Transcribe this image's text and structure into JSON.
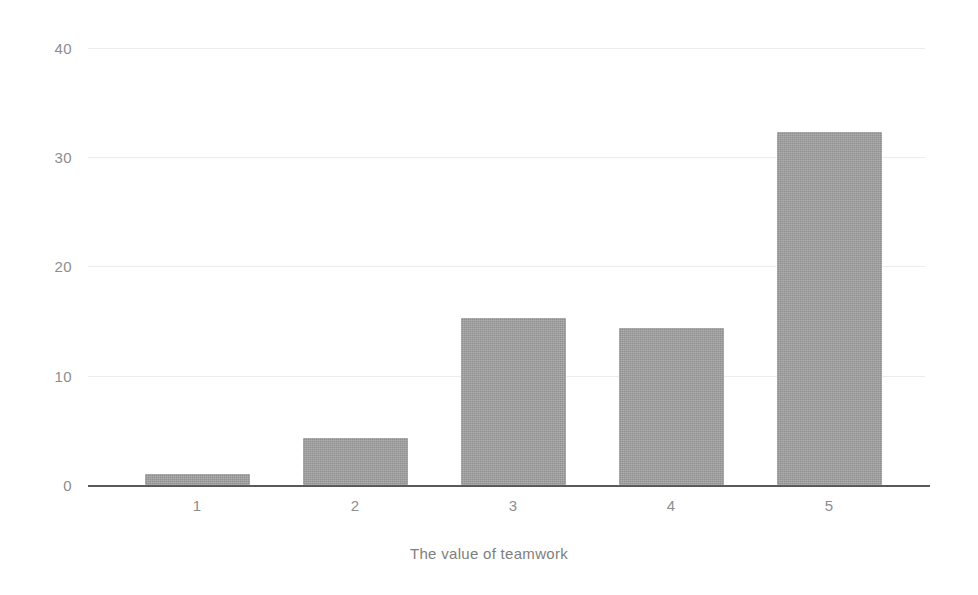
{
  "chart_data": {
    "type": "bar",
    "title": "",
    "subtitle": "",
    "xlabel": "The value of teamwork",
    "ylabel": "",
    "categories": [
      "1",
      "2",
      "3",
      "4",
      "5"
    ],
    "values": [
      1.0,
      4.3,
      15.3,
      14.4,
      32.3
    ],
    "series": [
      {
        "name": "Responses",
        "values": [
          1.0,
          4.3,
          15.3,
          14.4,
          32.3
        ]
      }
    ],
    "ylim": [
      0,
      40
    ],
    "yticks": [
      0,
      10,
      20,
      30,
      40
    ],
    "ytick_labels": [
      "0",
      "10",
      "20",
      "30",
      "40"
    ],
    "xtick_labels": [
      "1",
      "2",
      "3",
      "4",
      "5"
    ],
    "grid": true,
    "grid_axis": "y",
    "legend": false,
    "legend_position": "none",
    "colors": {
      "bar_fill": "#9c9c9c",
      "gridline": "#ececec",
      "axis_line": "#5a5a5a",
      "tick_label": "#8d8d8d",
      "axis_title": "#7e7e7e",
      "background": "#ffffff"
    }
  }
}
